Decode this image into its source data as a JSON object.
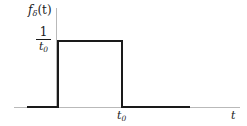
{
  "figure": {
    "background_color": "#ffffff",
    "trace_color": "#1a1a1a",
    "axis_color": "#b9b9b9"
  },
  "labels": {
    "y_axis_label_function": "f",
    "y_axis_label_subscript": "δ",
    "y_axis_label_argument": "(t)",
    "x_axis_label": "t",
    "y_value_numerator": "1",
    "y_value_denominator_base": "t",
    "y_value_denominator_subscript": "0",
    "x_tick_base": "t",
    "x_tick_subscript": "0"
  },
  "chart_data": {
    "type": "line",
    "title": "",
    "subtitle": "",
    "xlabel": "t",
    "ylabel": "f_δ(t)",
    "grid": false,
    "legend": null,
    "xlim": [
      -0.45,
      2.6
    ],
    "ylim": [
      0,
      1.25
    ],
    "xticks": [
      1
    ],
    "xticklabels": [
      "t₀"
    ],
    "yticks": [
      1
    ],
    "yticklabels": [
      "1/t₀"
    ],
    "annotations": [
      {
        "text": "fδ(t)",
        "position": "top of y-axis"
      },
      {
        "text": "1/t₀",
        "position": "left of y-axis at pulse height"
      },
      {
        "text": "t₀",
        "position": "below x-axis at falling edge"
      },
      {
        "text": "t",
        "position": "right end of x-axis"
      }
    ],
    "series": [
      {
        "name": "f_delta(t)",
        "description": "Unit-area rectangular pulse of width t0 and height 1/t0",
        "x": [
          -0.45,
          0,
          0,
          1,
          1,
          2.15
        ],
        "y": [
          0,
          0,
          1,
          1,
          0,
          0
        ]
      }
    ]
  }
}
